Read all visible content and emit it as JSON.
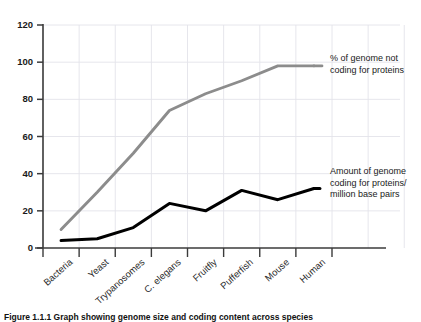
{
  "chart_data": {
    "type": "line",
    "title": "",
    "xlabel": "",
    "ylabel": "",
    "ylim": [
      0,
      120
    ],
    "yticks": [
      0,
      20,
      40,
      60,
      80,
      100,
      120
    ],
    "grid": true,
    "legend_position": "right-inline-annotations",
    "categories": [
      "Bacteria",
      "Yeast",
      "Trypanosomes",
      "C. elegans",
      "Fruitfly",
      "Pufferfish",
      "Mouse",
      "Human"
    ],
    "series": [
      {
        "name": "% of genome not coding for proteins",
        "color": "#8c8c8c",
        "values": [
          10,
          30,
          51,
          74,
          83,
          90,
          98,
          98
        ]
      },
      {
        "name": "Amount of genome coding for proteins/ million base pairs",
        "color": "#000000",
        "values": [
          4,
          5,
          11,
          24,
          20,
          31,
          26,
          32
        ]
      }
    ],
    "annotations": [
      {
        "id": "gray-annotation",
        "text": "% of genome not\ncoding for proteins"
      },
      {
        "id": "black-annotation",
        "text": "Amount of genome\ncoding for proteins/\nmillion base pairs"
      }
    ]
  },
  "figure": {
    "caption": "Figure 1.1.1  Graph showing genome size and coding content across species"
  },
  "colors": {
    "series_gray": "#8c8c8c",
    "series_black": "#000000",
    "axis": "#3b3b3b",
    "grid": "#e3e3ea",
    "background": "#ffffff"
  }
}
